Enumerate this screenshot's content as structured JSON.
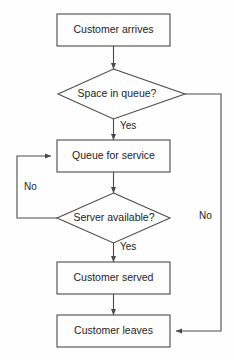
{
  "diagram": {
    "background_color": "#fefefe",
    "line_color": "#4a4a4a",
    "text_color": "#1c1c1c",
    "nodes": [
      {
        "id": "customer-arrives",
        "shape": "process",
        "label": "Customer arrives"
      },
      {
        "id": "space-in-queue",
        "shape": "decision",
        "label": "Space in queue?"
      },
      {
        "id": "queue-for-service",
        "shape": "process",
        "label": "Queue for service"
      },
      {
        "id": "server-available",
        "shape": "decision",
        "label": "Server available?"
      },
      {
        "id": "customer-served",
        "shape": "process",
        "label": "Customer served"
      },
      {
        "id": "customer-leaves",
        "shape": "process",
        "label": "Customer leaves"
      }
    ],
    "edges": [
      {
        "id": "e1",
        "from": "customer-arrives",
        "to": "space-in-queue",
        "label": ""
      },
      {
        "id": "e2",
        "from": "space-in-queue",
        "to": "queue-for-service",
        "label": "Yes"
      },
      {
        "id": "e3",
        "from": "space-in-queue",
        "to": "customer-leaves",
        "label": "No"
      },
      {
        "id": "e4",
        "from": "queue-for-service",
        "to": "server-available",
        "label": ""
      },
      {
        "id": "e5",
        "from": "server-available",
        "to": "queue-for-service",
        "label": "No"
      },
      {
        "id": "e6",
        "from": "server-available",
        "to": "customer-served",
        "label": "Yes"
      },
      {
        "id": "e7",
        "from": "customer-served",
        "to": "customer-leaves",
        "label": ""
      }
    ]
  }
}
